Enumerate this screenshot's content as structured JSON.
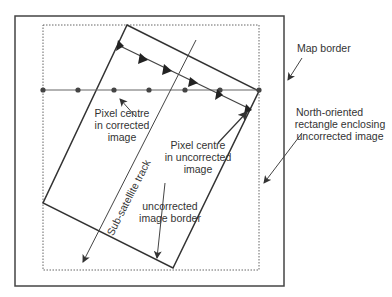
{
  "diagram": {
    "labels": {
      "map_border": "Map border",
      "north_rect_1": "North-oriented",
      "north_rect_2": "rectangle enclosing",
      "north_rect_3": "uncorrected image",
      "pixel_corr_1": "Pixel centre",
      "pixel_corr_2": "in corrected",
      "pixel_corr_3": "image",
      "pixel_uncorr_1": "Pixel centre",
      "pixel_uncorr_2": "in uncorrected",
      "pixel_uncorr_3": "image",
      "uncorr_border_1": "uncorrected",
      "uncorr_border_2": "image border",
      "track": "Sub-satellite track"
    },
    "colors": {
      "line": "#333333",
      "gray": "#777777"
    }
  }
}
